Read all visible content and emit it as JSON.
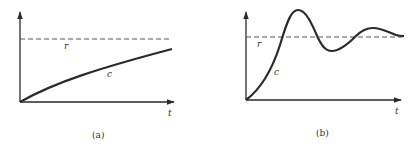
{
  "figure": {
    "panels": [
      {
        "id": "a",
        "caption": "(a)",
        "labels": {
          "reference": "r",
          "response": "c",
          "time_axis": "t"
        },
        "description": "Overdamped (monotonic) response c approaching reference r asymptotically"
      },
      {
        "id": "b",
        "caption": "(b)",
        "labels": {
          "reference": "r",
          "response": "c",
          "time_axis": "t"
        },
        "description": "Underdamped (oscillatory) response c overshooting and settling around reference r"
      }
    ],
    "colors": {
      "ink": "#2a2a2a",
      "dashed": "#555555",
      "background": "#ffffff"
    }
  }
}
